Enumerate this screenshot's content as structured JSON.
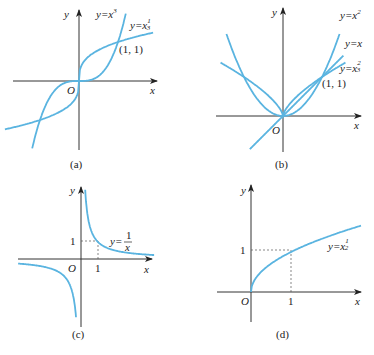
{
  "color": {
    "curve": "#5ab4e0",
    "axis": "#333333"
  },
  "panels": [
    {
      "caption": "(a)",
      "origin": [
        79,
        81
      ],
      "unit": 39,
      "xaxis": [
        13,
        157
      ],
      "yaxis": [
        10,
        150
      ],
      "x_label": "x",
      "y_label": "y",
      "origin_label": "O",
      "point_label": "(1, 1)",
      "curves": [
        {
          "name": "y=x^3",
          "label": "y=x",
          "exp_label": "3",
          "expr": "cube",
          "xrange": [
            -1.2,
            1.2
          ]
        },
        {
          "name": "y=x^(1/3)",
          "label": "y=x",
          "exp_label": "1/3",
          "expr": "cbrt",
          "xrange": [
            -1.9,
            1.9
          ]
        }
      ]
    },
    {
      "caption": "(b)",
      "origin": [
        283,
        116
      ],
      "unit": 39,
      "xaxis": [
        216,
        361
      ],
      "yaxis": [
        10,
        150
      ],
      "x_label": "x",
      "y_label": "y",
      "origin_label": "O",
      "point_label": "(1, 1)",
      "curves": [
        {
          "name": "y=x^2",
          "label": "y=x",
          "exp_label": "2",
          "expr": "square",
          "xrange": [
            -1.5,
            1.5
          ]
        },
        {
          "name": "y=x",
          "label": "y=x",
          "exp_label": "",
          "expr": "identity",
          "xrange": [
            -0.8,
            1.5
          ]
        },
        {
          "name": "y=x^(2/3)",
          "label": "y=x",
          "exp_label": "2/3",
          "expr": "twothirds",
          "xrange": [
            -1.6,
            1.6
          ]
        }
      ]
    },
    {
      "caption": "(c)",
      "origin": [
        81,
        259
      ],
      "unit": 17,
      "xaxis": [
        18,
        152
      ],
      "yaxis": [
        185,
        325
      ],
      "x_label": "x",
      "y_label": "y",
      "origin_label": "O",
      "tick_x": "1",
      "tick_y": "1",
      "curves": [
        {
          "name": "y=1/x",
          "label": "y=",
          "frac_num": "1",
          "frac_den": "x",
          "expr": "recip"
        }
      ]
    },
    {
      "caption": "(d)",
      "origin": [
        251,
        292
      ],
      "unit": 40,
      "xaxis": [
        217,
        361
      ],
      "yaxis": [
        185,
        322
      ],
      "x_label": "x",
      "y_label": "y",
      "origin_label": "O",
      "tick_x": "1",
      "tick_y": "1",
      "curves": [
        {
          "name": "y=x^(1/2)",
          "label": "y=x",
          "exp_label": "1/2",
          "expr": "sqrt",
          "xrange": [
            0,
            3.5
          ]
        }
      ]
    }
  ]
}
